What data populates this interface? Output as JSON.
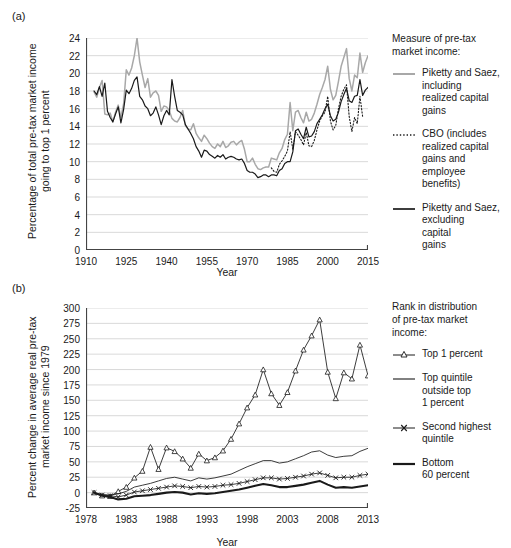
{
  "figure": {
    "panel_a_tag": "(a)",
    "panel_b_tag": "(b)"
  },
  "panel_a": {
    "ylabel": "Percentage of total pre-tax market income\ngoing to top 1 percent",
    "xlabel": "Year",
    "legend_title": "Measure of pre-tax\nmarket income:",
    "legend": [
      {
        "key": "solid-gray-line",
        "label": "Piketty and Saez,\nincluding\nrealized capital\ngains",
        "color": "#a8a8a8"
      },
      {
        "key": "dotted-black-line",
        "label": "CBO (includes\nrealized capital\ngains and\nemployee\nbenefits)",
        "color": "#1a1a1a"
      },
      {
        "key": "solid-black-line",
        "label": "Piketty and Saez,\nexcluding\ncapital\ngains",
        "color": "#1a1a1a"
      }
    ]
  },
  "panel_b": {
    "ylabel": "Percent change in average real pre-tax\nmarket income since 1979",
    "xlabel": "Year",
    "legend_title": "Rank in distribution\nof pre-tax market\nincome:",
    "legend": [
      {
        "key": "triangle-marker-line",
        "label": "Top 1 percent",
        "color": "#1a1a1a"
      },
      {
        "key": "thin-solid-line",
        "label": "Top quintile\noutside top\n1 percent",
        "color": "#1a1a1a"
      },
      {
        "key": "cross-marker-line",
        "label": "Second highest\nquintile",
        "color": "#1a1a1a"
      },
      {
        "key": "thick-solid-line",
        "label": "Bottom\n60 percent",
        "color": "#1a1a1a"
      }
    ]
  },
  "chart_data": [
    {
      "type": "line",
      "panel": "(a)",
      "title": "",
      "xlabel": "Year",
      "ylabel": "Percentage of total pre-tax market income going to top 1 percent",
      "xlim": [
        1910,
        2015
      ],
      "ylim": [
        0,
        24
      ],
      "xticks": [
        1910,
        1925,
        1940,
        1955,
        1970,
        1985,
        2000,
        2015
      ],
      "yticks": [
        0,
        2,
        4,
        6,
        8,
        10,
        12,
        14,
        16,
        18,
        20,
        22,
        24
      ],
      "grid": "horizontal",
      "legend_position": "right",
      "series": [
        {
          "name": "Piketty and Saez, including realized capital gains",
          "style": "solid",
          "color": "#a8a8a8",
          "x": [
            1913,
            1914,
            1915,
            1916,
            1917,
            1918,
            1919,
            1920,
            1921,
            1922,
            1923,
            1924,
            1925,
            1926,
            1927,
            1928,
            1929,
            1930,
            1931,
            1932,
            1933,
            1934,
            1935,
            1936,
            1937,
            1938,
            1939,
            1940,
            1941,
            1942,
            1943,
            1944,
            1945,
            1946,
            1947,
            1948,
            1949,
            1950,
            1951,
            1952,
            1953,
            1954,
            1955,
            1956,
            1957,
            1958,
            1959,
            1960,
            1961,
            1962,
            1963,
            1964,
            1965,
            1966,
            1967,
            1968,
            1969,
            1970,
            1971,
            1972,
            1973,
            1974,
            1975,
            1976,
            1977,
            1978,
            1979,
            1980,
            1981,
            1982,
            1983,
            1984,
            1985,
            1986,
            1987,
            1988,
            1989,
            1990,
            1991,
            1992,
            1993,
            1994,
            1995,
            1996,
            1997,
            1998,
            1999,
            2000,
            2001,
            2002,
            2003,
            2004,
            2005,
            2006,
            2007,
            2008,
            2009,
            2010,
            2011,
            2012,
            2013,
            2014,
            2015
          ],
          "y": [
            17.9,
            17.3,
            18.4,
            19.2,
            15.4,
            15.3,
            15.5,
            14.5,
            15.6,
            16.4,
            15.0,
            16.5,
            20.4,
            19.8,
            20.6,
            22.0,
            24.0,
            21.3,
            19.8,
            18.4,
            19.4,
            17.3,
            17.8,
            18.0,
            17.5,
            15.7,
            16.3,
            16.2,
            15.8,
            14.9,
            14.6,
            14.5,
            15.0,
            15.8,
            14.1,
            13.7,
            13.6,
            14.3,
            13.2,
            12.7,
            12.3,
            13.0,
            12.6,
            12.1,
            11.7,
            11.5,
            12.0,
            11.7,
            12.3,
            11.6,
            11.8,
            12.2,
            12.3,
            11.9,
            12.2,
            12.4,
            11.4,
            10.0,
            10.0,
            10.4,
            9.7,
            9.2,
            9.1,
            9.3,
            9.4,
            9.4,
            10.4,
            10.3,
            10.2,
            11.0,
            11.5,
            12.5,
            13.1,
            16.7,
            13.5,
            15.6,
            15.8,
            15.0,
            14.4,
            15.6,
            14.6,
            14.8,
            15.5,
            16.5,
            17.6,
            18.4,
            19.3,
            20.8,
            18.2,
            17.0,
            17.5,
            19.1,
            20.8,
            21.8,
            22.8,
            19.4,
            18.0,
            19.8,
            19.5,
            22.3,
            20.1,
            21.2,
            22.0
          ]
        },
        {
          "name": "CBO (includes realized capital gains and employee benefits)",
          "style": "dotted",
          "color": "#1a1a1a",
          "x": [
            1979,
            1980,
            1981,
            1982,
            1983,
            1984,
            1985,
            1986,
            1987,
            1988,
            1989,
            1990,
            1991,
            1992,
            1993,
            1994,
            1995,
            1996,
            1997,
            1998,
            1999,
            2000,
            2001,
            2002,
            2003,
            2004,
            2005,
            2006,
            2007,
            2008,
            2009,
            2010,
            2011,
            2012,
            2013
          ],
          "y": [
            9.3,
            8.9,
            8.8,
            9.7,
            10.1,
            10.6,
            11.2,
            13.4,
            11.4,
            13.4,
            13.0,
            12.5,
            11.9,
            13.3,
            11.8,
            11.7,
            12.4,
            13.6,
            14.6,
            15.2,
            15.6,
            17.4,
            14.6,
            13.6,
            14.1,
            16.0,
            17.4,
            18.2,
            18.7,
            15.1,
            13.4,
            15.0,
            14.3,
            17.4,
            15.1
          ]
        },
        {
          "name": "Piketty and Saez, excluding capital gains",
          "style": "solid",
          "color": "#1a1a1a",
          "x": [
            1913,
            1914,
            1915,
            1916,
            1917,
            1918,
            1919,
            1920,
            1921,
            1922,
            1923,
            1924,
            1925,
            1926,
            1927,
            1928,
            1929,
            1930,
            1931,
            1932,
            1933,
            1934,
            1935,
            1936,
            1937,
            1938,
            1939,
            1940,
            1941,
            1942,
            1943,
            1944,
            1945,
            1946,
            1947,
            1948,
            1949,
            1950,
            1951,
            1952,
            1953,
            1954,
            1955,
            1956,
            1957,
            1958,
            1959,
            1960,
            1961,
            1962,
            1963,
            1964,
            1965,
            1966,
            1967,
            1968,
            1969,
            1970,
            1971,
            1972,
            1973,
            1974,
            1975,
            1976,
            1977,
            1978,
            1979,
            1980,
            1981,
            1982,
            1983,
            1984,
            1985,
            1986,
            1987,
            1988,
            1989,
            1990,
            1991,
            1992,
            1993,
            1994,
            1995,
            1996,
            1997,
            1998,
            1999,
            2000,
            2001,
            2002,
            2003,
            2004,
            2005,
            2006,
            2007,
            2008,
            2009,
            2010,
            2011,
            2012,
            2013,
            2014,
            2015
          ],
          "y": [
            18.0,
            17.6,
            18.5,
            17.4,
            18.9,
            15.7,
            15.0,
            14.5,
            15.4,
            16.2,
            14.4,
            15.9,
            18.1,
            17.7,
            18.3,
            19.2,
            19.6,
            17.4,
            17.0,
            16.3,
            16.0,
            15.2,
            15.5,
            16.2,
            15.3,
            14.2,
            15.2,
            15.8,
            15.3,
            19.3,
            17.4,
            15.8,
            15.6,
            15.3,
            14.2,
            13.7,
            13.2,
            12.6,
            11.7,
            11.2,
            10.5,
            11.3,
            11.2,
            10.8,
            10.6,
            10.4,
            10.7,
            10.5,
            10.8,
            10.3,
            10.5,
            10.6,
            10.5,
            10.3,
            10.2,
            10.3,
            9.8,
            9.0,
            8.8,
            8.8,
            8.6,
            8.2,
            8.3,
            8.5,
            8.5,
            8.3,
            8.5,
            8.5,
            8.4,
            9.0,
            9.2,
            9.8,
            10.0,
            10.0,
            11.1,
            13.5,
            13.7,
            13.1,
            12.6,
            13.9,
            12.8,
            12.9,
            13.4,
            14.3,
            14.8,
            15.3,
            16.0,
            16.5,
            15.2,
            14.6,
            14.8,
            15.6,
            16.8,
            17.6,
            18.3,
            16.9,
            16.7,
            17.4,
            17.5,
            19.3,
            17.5,
            18.1,
            18.4
          ]
        }
      ]
    },
    {
      "type": "line",
      "panel": "(b)",
      "title": "",
      "xlabel": "Year",
      "ylabel": "Percent change in average real pre-tax market income since 1979",
      "xlim": [
        1978,
        2013
      ],
      "ylim": [
        -25,
        300
      ],
      "xticks": [
        1978,
        1983,
        1988,
        1993,
        1998,
        2003,
        2008,
        2013
      ],
      "yticks": [
        -25,
        0,
        25,
        50,
        75,
        100,
        125,
        150,
        175,
        200,
        225,
        250,
        275,
        300
      ],
      "grid": "horizontal",
      "legend_position": "right",
      "x": [
        1979,
        1980,
        1981,
        1982,
        1983,
        1984,
        1985,
        1986,
        1987,
        1988,
        1989,
        1990,
        1991,
        1992,
        1993,
        1994,
        1995,
        1996,
        1997,
        1998,
        1999,
        2000,
        2001,
        2002,
        2003,
        2004,
        2005,
        2006,
        2007,
        2008,
        2009,
        2010,
        2011,
        2012,
        2013
      ],
      "series": [
        {
          "name": "Top 1 percent",
          "marker": "triangle",
          "style": "solid-thin",
          "color": "#1a1a1a",
          "values": [
            0,
            -5,
            -6,
            2,
            9,
            24,
            35,
            74,
            38,
            73,
            67,
            55,
            40,
            63,
            52,
            57,
            68,
            87,
            112,
            138,
            159,
            200,
            161,
            142,
            163,
            198,
            232,
            255,
            281,
            196,
            153,
            195,
            185,
            240,
            190
          ]
        },
        {
          "name": "Top quintile outside top 1 percent",
          "marker": "none",
          "style": "solid-thin",
          "color": "#1a1a1a",
          "values": [
            0,
            -3,
            -4,
            -2,
            2,
            9,
            12,
            15,
            19,
            23,
            25,
            22,
            19,
            24,
            22,
            24,
            27,
            30,
            36,
            42,
            47,
            52,
            52,
            48,
            50,
            55,
            60,
            66,
            68,
            61,
            57,
            59,
            60,
            67,
            72
          ]
        },
        {
          "name": "Second highest quintile",
          "marker": "cross",
          "style": "solid-thin",
          "color": "#1a1a1a",
          "values": [
            0,
            -4,
            -5,
            -7,
            -4,
            1,
            3,
            5,
            7,
            9,
            11,
            10,
            8,
            10,
            9,
            10,
            12,
            13,
            15,
            18,
            21,
            24,
            24,
            22,
            23,
            25,
            27,
            30,
            32,
            28,
            24,
            25,
            25,
            28,
            30
          ]
        },
        {
          "name": "Bottom 60 percent",
          "marker": "none",
          "style": "solid-thick",
          "color": "#1a1a1a",
          "values": [
            0,
            -5,
            -7,
            -11,
            -10,
            -6,
            -5,
            -4,
            -2,
            0,
            1,
            0,
            -3,
            -1,
            -2,
            -1,
            1,
            3,
            5,
            8,
            11,
            14,
            12,
            9,
            9,
            11,
            13,
            16,
            19,
            13,
            8,
            9,
            8,
            10,
            12
          ]
        }
      ]
    }
  ]
}
